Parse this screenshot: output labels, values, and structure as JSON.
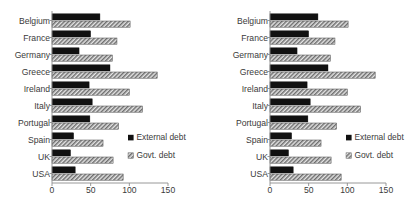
{
  "chart_data": [
    {
      "id": "left",
      "type": "bar",
      "orientation": "horizontal",
      "title": "",
      "xlabel": "",
      "ylabel": "",
      "categories": [
        "Belgium",
        "France",
        "Germany",
        "Greece",
        "Ireland",
        "Italy",
        "Portugal",
        "Spain",
        "UK",
        "USA"
      ],
      "series": [
        {
          "name": "External debt",
          "color": "#111111",
          "values": [
            62,
            50,
            35,
            75,
            48,
            52,
            49,
            28,
            24,
            30
          ]
        },
        {
          "name": "Govt. debt",
          "color": "#d8d8d8",
          "values": [
            101,
            84,
            78,
            136,
            100,
            117,
            86,
            66,
            79,
            92
          ]
        }
      ],
      "xlim": [
        0,
        150
      ],
      "xticks": [
        0,
        50,
        100,
        150
      ],
      "xticklabels": [
        "0",
        "50",
        "100",
        "150"
      ],
      "grid": false,
      "legend_position": "bottom-right",
      "legend": [
        "External debt",
        "Govt. debt"
      ]
    },
    {
      "id": "right",
      "type": "bar",
      "orientation": "horizontal",
      "title": "",
      "xlabel": "",
      "ylabel": "",
      "categories": [
        "Belgium",
        "France",
        "Germany",
        "Greece",
        "Ireland",
        "Italy",
        "Portugal",
        "Spain",
        "UK",
        "USA"
      ],
      "series": [
        {
          "name": "External debt",
          "color": "#111111",
          "values": [
            62,
            50,
            35,
            75,
            48,
            52,
            49,
            28,
            24,
            30
          ]
        },
        {
          "name": "Govt. debt",
          "color": "#d8d8d8",
          "values": [
            101,
            84,
            78,
            136,
            100,
            117,
            86,
            66,
            79,
            92
          ]
        }
      ],
      "xlim": [
        0,
        150
      ],
      "xticks": [
        0,
        50,
        100,
        150
      ],
      "xticklabels": [
        "0",
        "50",
        "100",
        "150"
      ],
      "grid": false,
      "legend_position": "bottom-right",
      "legend": [
        "External debt",
        "Govt. debt"
      ]
    }
  ],
  "layout": {
    "left_panel": {
      "plot_x0": 52,
      "plot_x1": 168,
      "plot_y0": 12,
      "plot_y1": 182,
      "label_right": 50,
      "tick_y": 193,
      "legend_x": 128,
      "legend_y1": 140,
      "legend_y2": 158
    },
    "right_panel": {
      "plot_x0": 61,
      "plot_x1": 177,
      "plot_y0": 12,
      "plot_y1": 182,
      "label_right": 59,
      "tick_y": 193,
      "legend_x": 137,
      "legend_y1": 140,
      "legend_y2": 158
    }
  },
  "colors": {
    "external_debt": "#111111",
    "govt_debt_fill": "#d8d8d8",
    "axis": "#8c8c8c",
    "text": "#3a3a3a",
    "background": "#ffffff"
  }
}
